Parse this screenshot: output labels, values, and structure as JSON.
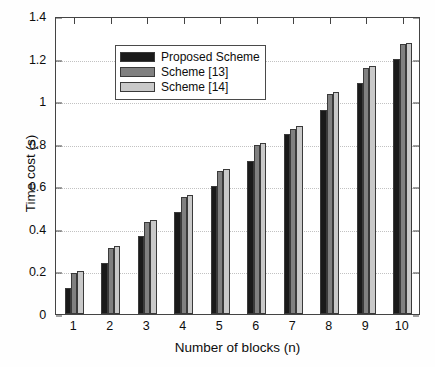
{
  "chart_data": {
    "type": "bar",
    "title": "",
    "xlabel": "Number of blocks (n)",
    "ylabel": "Time cost (s)",
    "categories": [
      "1",
      "2",
      "3",
      "4",
      "5",
      "6",
      "7",
      "8",
      "9",
      "10"
    ],
    "series": [
      {
        "name": "Proposed Scheme",
        "color": "#1a1a1a",
        "values": [
          0.12,
          0.24,
          0.365,
          0.48,
          0.6,
          0.72,
          0.845,
          0.96,
          1.085,
          1.2
        ]
      },
      {
        "name": "Scheme [13]",
        "color": "#808080",
        "values": [
          0.195,
          0.31,
          0.43,
          0.55,
          0.67,
          0.795,
          0.87,
          1.035,
          1.155,
          1.27
        ]
      },
      {
        "name": "Scheme [14]",
        "color": "#c9c9c9",
        "values": [
          0.2,
          0.32,
          0.44,
          0.56,
          0.68,
          0.805,
          0.885,
          1.045,
          1.165,
          1.275
        ]
      }
    ],
    "ylim": [
      0,
      1.4
    ],
    "y_ticks": [
      "0",
      "0.2",
      "0.4",
      "0.6",
      "0.8",
      "1",
      "1.2",
      "1.4"
    ],
    "y_tick_values": [
      0,
      0.2,
      0.4,
      0.6,
      0.8,
      1.0,
      1.2,
      1.4
    ],
    "grid": true,
    "legend_position": "upper-left",
    "axis_color": "#444444",
    "grid_color": "#c2c2c2",
    "background": "#ffffff"
  },
  "legend": {
    "entries": [
      {
        "label": "Proposed Scheme"
      },
      {
        "label": "Scheme [13]"
      },
      {
        "label": "Scheme [14]"
      }
    ]
  }
}
